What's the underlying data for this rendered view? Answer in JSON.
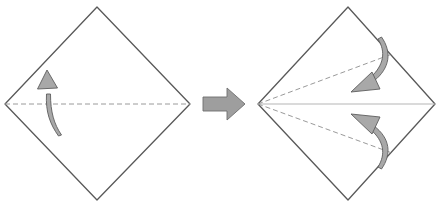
{
  "figure": {
    "type": "instructional-diagram",
    "background_color": "#ffffff",
    "step_count": 2
  },
  "style": {
    "paper_outline_color": "#595959",
    "paper_fill_color": "#ffffff",
    "crease_dashed_color": "#9a9a9a",
    "crease_solid_color": "#b5b5b5",
    "arrow_fill_color": "#a8a8a8",
    "arrow_stroke_color": "#5e5e5e",
    "step_arrow_fill_color": "#9e9e9e",
    "step_arrow_stroke_color": "#6e6e6e",
    "outline_width": "1.3",
    "crease_width": "1",
    "dash_pattern": "5,3"
  },
  "panels": [
    {
      "id": "panel-before",
      "label": "before-fold",
      "shape": "square-rotated-45",
      "vertices": {
        "top": [
          97,
          7
        ],
        "right": [
          190,
          104
        ],
        "bottom": [
          97,
          200
        ],
        "left": [
          5,
          104
        ]
      },
      "creases": [
        {
          "id": "horizontal-center-crease",
          "kind": "dashed",
          "from": [
            5,
            104
          ],
          "to": [
            190,
            104
          ]
        }
      ],
      "arrows": [
        {
          "id": "fold-up-arrow",
          "direction": "up",
          "meaning": "fold bottom half up along center crease",
          "tail": [
            52,
            136
          ],
          "head": [
            47,
            72
          ]
        }
      ]
    },
    {
      "id": "panel-after",
      "label": "after-fold-with-new-creases",
      "shape": "square-rotated-45",
      "vertices": {
        "top": [
          348,
          7
        ],
        "right": [
          435,
          104
        ],
        "bottom": [
          348,
          200
        ],
        "left": [
          258,
          104
        ]
      },
      "creases": [
        {
          "id": "horizontal-center-crease",
          "kind": "solid",
          "from": [
            258,
            104
          ],
          "to": [
            435,
            104
          ]
        },
        {
          "id": "upper-diagonal-crease",
          "kind": "dashed",
          "from": [
            258,
            104
          ],
          "to": [
            392,
            54
          ]
        },
        {
          "id": "lower-diagonal-crease",
          "kind": "dashed",
          "from": [
            258,
            104
          ],
          "to": [
            392,
            153
          ]
        }
      ],
      "arrows": [
        {
          "id": "fold-upper-edge-down-arrow",
          "direction": "down-left",
          "meaning": "fold upper edge down to center line",
          "tail": [
            383,
            38
          ],
          "head": [
            356,
            90
          ]
        },
        {
          "id": "fold-lower-edge-up-arrow",
          "direction": "up-left",
          "meaning": "fold lower edge up to center line",
          "tail": [
            383,
            168
          ],
          "head": [
            356,
            117
          ]
        }
      ]
    }
  ],
  "step_arrow": {
    "id": "step-transition-arrow",
    "direction": "right",
    "meaning": "proceeds to next step",
    "from": [
      203,
      104
    ],
    "to": [
      244,
      104
    ]
  }
}
